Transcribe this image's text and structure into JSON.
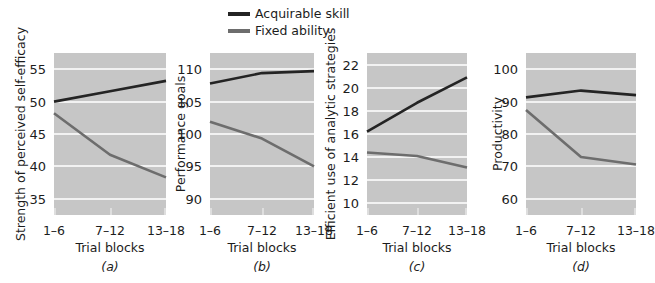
{
  "figure": {
    "background": "#ffffff",
    "plot_background": "#c6c6c6",
    "gridline_color": "#f2f2f2"
  },
  "legend": {
    "position": "top-center",
    "entries": [
      {
        "label": "Acquirable skill",
        "color": "#242424"
      },
      {
        "label": "Fixed ability",
        "color": "#6d6d6d"
      }
    ]
  },
  "shared": {
    "xlabel": "Trial blocks",
    "xticks": [
      "1–6",
      "7–12",
      "13–18"
    ]
  },
  "chart_data": [
    {
      "type": "line",
      "title": "",
      "caption": "(a)",
      "xlabel": "Trial blocks",
      "ylabel": "Strength of perceived self-efficacy",
      "categories": [
        "1–6",
        "7–12",
        "13–18"
      ],
      "yticks": [
        35,
        40,
        45,
        50,
        55
      ],
      "ylim": [
        32.5,
        57.5
      ],
      "grid": true,
      "legend_position": "top-center",
      "series": [
        {
          "name": "Acquirable skill",
          "color": "#242424",
          "values": [
            50.0,
            51.6,
            53.2
          ]
        },
        {
          "name": "Fixed ability",
          "color": "#6d6d6d",
          "values": [
            48.2,
            41.8,
            38.3
          ]
        }
      ]
    },
    {
      "type": "line",
      "title": "",
      "caption": "(b)",
      "xlabel": "Trial blocks",
      "ylabel": "Performance goals",
      "categories": [
        "1–6",
        "7–12",
        "13–18"
      ],
      "yticks": [
        90,
        95,
        100,
        105,
        110
      ],
      "ylim": [
        87.5,
        112.5
      ],
      "grid": true,
      "legend_position": "top-center",
      "series": [
        {
          "name": "Acquirable skill",
          "color": "#242424",
          "values": [
            107.8,
            109.4,
            109.7
          ]
        },
        {
          "name": "Fixed ability",
          "color": "#6d6d6d",
          "values": [
            101.9,
            99.3,
            95.0
          ]
        }
      ]
    },
    {
      "type": "line",
      "title": "",
      "caption": "(c)",
      "xlabel": "Trial blocks",
      "ylabel": "Efficient use of analytic strategies",
      "categories": [
        "1–6",
        "7–12",
        "13–18"
      ],
      "yticks": [
        10,
        12,
        14,
        16,
        18,
        20,
        22
      ],
      "ylim": [
        9.0,
        23.0
      ],
      "grid": true,
      "legend_position": "top-center",
      "series": [
        {
          "name": "Acquirable skill",
          "color": "#242424",
          "values": [
            16.2,
            18.7,
            20.9
          ]
        },
        {
          "name": "Fixed ability",
          "color": "#6d6d6d",
          "values": [
            14.4,
            14.1,
            13.1
          ]
        }
      ]
    },
    {
      "type": "line",
      "title": "",
      "caption": "(d)",
      "xlabel": "Trial blocks",
      "ylabel": "Productivity",
      "categories": [
        "1–6",
        "7–12",
        "13–18"
      ],
      "yticks": [
        60,
        70,
        80,
        90,
        100
      ],
      "ylim": [
        55,
        105
      ],
      "grid": true,
      "legend_position": "top-center",
      "series": [
        {
          "name": "Acquirable skill",
          "color": "#242424",
          "values": [
            91.3,
            93.4,
            92.0
          ]
        },
        {
          "name": "Fixed ability",
          "color": "#6d6d6d",
          "values": [
            87.4,
            72.9,
            70.6
          ]
        }
      ]
    }
  ]
}
